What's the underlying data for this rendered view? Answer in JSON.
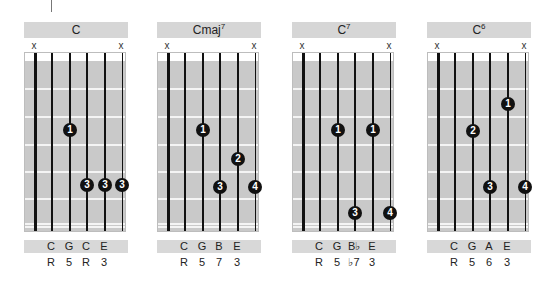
{
  "marker": {
    "visible": true
  },
  "chords": [
    {
      "name": "C",
      "sup": "",
      "left": 24,
      "mutes": [
        "x",
        "x"
      ],
      "dots": [
        {
          "finger": "1",
          "string": 2,
          "y": 129
        },
        {
          "finger": "3",
          "string": 3,
          "y": 184
        },
        {
          "finger": "3",
          "string": 4,
          "y": 184
        },
        {
          "finger": "3",
          "string": 5,
          "y": 184
        }
      ],
      "notes": [
        "C",
        "G",
        "C",
        "E"
      ],
      "degrees": [
        "R",
        "5",
        "R",
        "3"
      ]
    },
    {
      "name": "Cmaj",
      "sup": "7",
      "left": 157,
      "mutes": [
        "x",
        "x"
      ],
      "dots": [
        {
          "finger": "1",
          "string": 2,
          "y": 129
        },
        {
          "finger": "2",
          "string": 4,
          "y": 158
        },
        {
          "finger": "3",
          "string": 3,
          "y": 186
        },
        {
          "finger": "4",
          "string": 5,
          "y": 186
        }
      ],
      "notes": [
        "C",
        "G",
        "B",
        "E"
      ],
      "degrees": [
        "R",
        "5",
        "7",
        "3"
      ]
    },
    {
      "name": "C",
      "sup": "7",
      "left": 292,
      "mutes": [
        "x",
        "x"
      ],
      "dots": [
        {
          "finger": "1",
          "string": 2,
          "y": 129
        },
        {
          "finger": "1",
          "string": 4,
          "y": 129
        },
        {
          "finger": "3",
          "string": 3,
          "y": 212
        },
        {
          "finger": "4",
          "string": 5,
          "y": 212
        }
      ],
      "notes": [
        "C",
        "G",
        "B♭",
        "E"
      ],
      "degrees": [
        "R",
        "5",
        "♭7",
        "3"
      ]
    },
    {
      "name": "C",
      "sup": "6",
      "left": 427,
      "mutes": [
        "x",
        "x"
      ],
      "dots": [
        {
          "finger": "1",
          "string": 4,
          "y": 103
        },
        {
          "finger": "2",
          "string": 2,
          "y": 130
        },
        {
          "finger": "3",
          "string": 3,
          "y": 186
        },
        {
          "finger": "4",
          "string": 5,
          "y": 186
        }
      ],
      "notes": [
        "C",
        "G",
        "A",
        "E"
      ],
      "degrees": [
        "R",
        "5",
        "6",
        "3"
      ]
    }
  ],
  "layout": {
    "string_x": [
      10,
      27,
      45,
      62,
      80,
      97
    ],
    "string_w": [
      3,
      2,
      2,
      1.5,
      1.5,
      1
    ],
    "fret_y": [
      35,
      63,
      91,
      118,
      145,
      170,
      173
    ],
    "label_x": [
      27,
      45,
      62,
      80
    ]
  }
}
